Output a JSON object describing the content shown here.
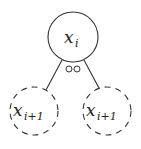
{
  "diagram": {
    "type": "tree",
    "colors": {
      "stroke": "#333333",
      "text": "#222222",
      "background": "#ffffff"
    },
    "root": {
      "label": "x",
      "subscript": "i",
      "style": "solid"
    },
    "children": [
      {
        "label": "x",
        "subscript": "i+1",
        "style": "dashed"
      },
      {
        "label": "x",
        "subscript": "i+1",
        "style": "dashed"
      }
    ],
    "edge_marker": "oo"
  }
}
